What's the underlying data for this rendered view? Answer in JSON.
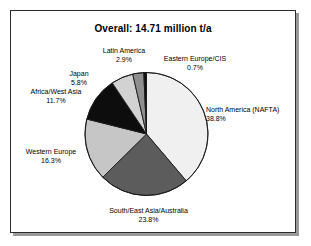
{
  "chart_data": {
    "type": "pie",
    "title": "Overall: 14.71 million t/a",
    "total_label": "14.71 million t/a",
    "unit": "million t/a",
    "total_value": 14.71,
    "categories": [
      "North America (NAFTA)",
      "South/East Asia/Australia",
      "Western Europe",
      "Africa/West Asia",
      "Japan",
      "Latin America",
      "Eastern Europe/CIS"
    ],
    "values": [
      38.8,
      23.8,
      16.3,
      11.7,
      5.8,
      2.9,
      0.7
    ],
    "value_unit": "%",
    "legend": "none",
    "grid": false,
    "start_angle_deg": 0,
    "direction": "clockwise",
    "slices": [
      {
        "name": "North America (NAFTA)",
        "label": "North America (NAFTA)",
        "pct": "38.8%",
        "value": 38.8,
        "color": "#f0f0f0"
      },
      {
        "name": "South/East Asia/Australia",
        "label": "South/East Asia/Australia",
        "pct": "23.8%",
        "value": 23.8,
        "color": "#5c5c5c"
      },
      {
        "name": "Western Europe",
        "label": "Western Europe",
        "pct": "16.3%",
        "value": 16.3,
        "color": "#c6c6c6"
      },
      {
        "name": "Africa/West Asia",
        "label": "Africa/West Asia",
        "pct": "11.7%",
        "value": 11.7,
        "color": "#0d0d0d"
      },
      {
        "name": "Japan",
        "label": "Japan",
        "pct": "5.8%",
        "value": 5.8,
        "color": "#d2d2d2"
      },
      {
        "name": "Latin America",
        "label": "Latin America",
        "pct": "2.9%",
        "value": 2.9,
        "color": "#8f8f8f"
      },
      {
        "name": "Eastern Europe/CIS",
        "label": "Eastern Europe/CIS",
        "pct": "0.7%",
        "value": 0.7,
        "color": "#111111"
      }
    ]
  },
  "figure": {
    "title": "Overall: 14.71 million t/a",
    "border_color": "#2b2b2b",
    "background": "#ffffff",
    "slice_outline_color": "#1a1a1a"
  }
}
